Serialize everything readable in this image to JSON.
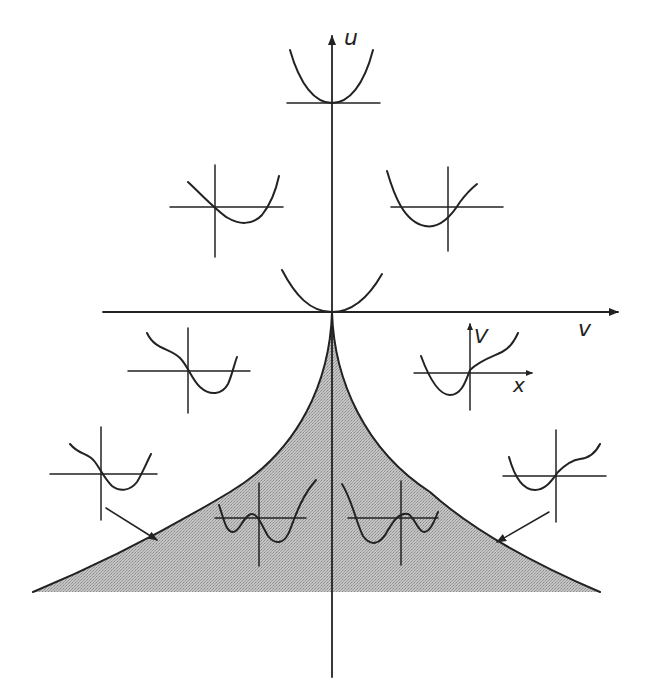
{
  "diagram": {
    "type": "cusp-catastrophe-bifurcation-diagram",
    "axes": {
      "vertical_label": "u",
      "horizontal_label": "v"
    },
    "inset_axis_labels": {
      "potential": "V",
      "state": "x"
    },
    "colors": {
      "ink": "#222222",
      "shaded_region": "#b8b8b8",
      "background": "#ffffff"
    },
    "regions": [
      {
        "name": "bifurcation-set",
        "description": "shaded cusp region below origin bounded by two curves meeting at the origin"
      },
      {
        "name": "outside",
        "description": "single-minimum potentials"
      }
    ],
    "insets": [
      {
        "id": "top",
        "shape": "single-well parabola, minimum on axis"
      },
      {
        "id": "upper-left",
        "shape": "single well, minimum right of axis"
      },
      {
        "id": "upper-right",
        "shape": "single well, minimum left of axis"
      },
      {
        "id": "origin",
        "shape": "flat single well at origin"
      },
      {
        "id": "mid-left",
        "shape": "single well with inflection on left"
      },
      {
        "id": "mid-right",
        "shape": "single well with inflection on right, labeled axes V and x"
      },
      {
        "id": "lower-left",
        "shape": "single well with shoulder on left"
      },
      {
        "id": "lower-right",
        "shape": "single well with shoulder on right"
      },
      {
        "id": "inside-left",
        "shape": "double well, deeper right minimum"
      },
      {
        "id": "inside-right",
        "shape": "double well, deeper left minimum"
      }
    ],
    "arrows": [
      {
        "from": "lower-left inset",
        "to": "left boundary curve"
      },
      {
        "from": "lower-right inset",
        "to": "right boundary curve"
      }
    ]
  }
}
